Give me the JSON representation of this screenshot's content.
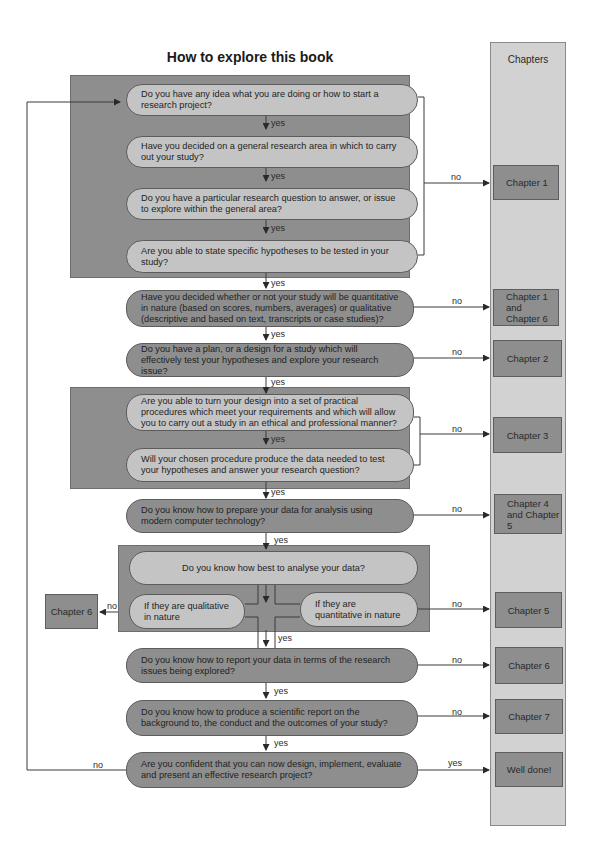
{
  "title": "How to explore this book",
  "chapters_header": "Chapters",
  "questions": [
    {
      "id": "q1",
      "text": "Do you have any idea what you are doing or how to start a research project?"
    },
    {
      "id": "q2",
      "text": "Have you decided on a general research area in which to carry out your study?"
    },
    {
      "id": "q3",
      "text": "Do you have a particular research question to answer, or issue to explore within the general area?"
    },
    {
      "id": "q4",
      "text": "Are you able to state specific hypotheses to be tested in your study?"
    },
    {
      "id": "q5",
      "text": "Have you decided whether or not your study will be quantitative in nature (based on scores, numbers, averages) or qualitative (descriptive and based on text, transcripts or case studies)?"
    },
    {
      "id": "q6",
      "text": "Do you have a plan, or a design for a study which will effectively test your hypotheses and explore your research issue?"
    },
    {
      "id": "q7",
      "text": "Are you able to turn your design into a set of practical procedures which meet your requirements and which will allow you to carry out a study in an ethical and professional manner?"
    },
    {
      "id": "q8",
      "text": "Will your chosen procedure produce the data needed to test your hypotheses and answer your research question?"
    },
    {
      "id": "q9",
      "text": "Do you know how to prepare your data for analysis using modern computer technology?"
    },
    {
      "id": "q10",
      "text": "Do you know how best to analyse your data?"
    },
    {
      "id": "q10a",
      "text": "If they are qualitative in nature"
    },
    {
      "id": "q10b",
      "text": "If they are quantitative in nature"
    },
    {
      "id": "q11",
      "text": "Do you know how to report your data in terms of the research issues being explored?"
    },
    {
      "id": "q12",
      "text": "Do you know how to produce a scientific report on the background to, the conduct and the outcomes of your study?"
    },
    {
      "id": "q13",
      "text": "Are you confident that you can now design, implement, evaluate and present an effective research project?"
    }
  ],
  "chapters": [
    {
      "id": "c1",
      "text": "Chapter 1"
    },
    {
      "id": "c1_6",
      "text": "Chapter 1 and Chapter 6"
    },
    {
      "id": "c2",
      "text": "Chapter 2"
    },
    {
      "id": "c3",
      "text": "Chapter 3"
    },
    {
      "id": "c4_5",
      "text": "Chapter 4 and Chapter 5"
    },
    {
      "id": "c5",
      "text": "Chapter 5"
    },
    {
      "id": "c6",
      "text": "Chapter 6"
    },
    {
      "id": "c7",
      "text": "Chapter 7"
    },
    {
      "id": "done",
      "text": "Well done!"
    },
    {
      "id": "c6_left",
      "text": "Chapter 6"
    }
  ],
  "labels": {
    "yes": "yes",
    "no": "no"
  },
  "colors": {
    "group_fill": "#8e8e8e",
    "pill_light": "#c4c4c4",
    "pill_dark": "#8e8e8e",
    "chapter_column": "#d2d2d2",
    "chapter_box": "#8e8e8e",
    "line": "#3a3a3a"
  }
}
